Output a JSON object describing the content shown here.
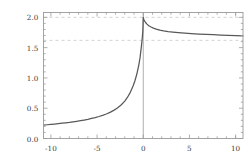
{
  "chart_data": {
    "type": "line",
    "title": "",
    "xlabel": "",
    "ylabel": "",
    "xlim": [
      -10.8,
      10.8
    ],
    "ylim": [
      0.0,
      2.08
    ],
    "grid": false,
    "frame": true,
    "legend": null,
    "x_ticks": [
      -10,
      -5,
      0,
      5,
      10
    ],
    "x_tick_labels": [
      "-10",
      "-5",
      "0",
      "5",
      "10"
    ],
    "x_minor_ticks": [
      -9,
      -8,
      -7,
      -6,
      -4,
      -3,
      -2,
      -1,
      1,
      2,
      3,
      4,
      6,
      7,
      8,
      9,
      10
    ],
    "y_ticks": [
      0.0,
      0.5,
      1.0,
      1.5,
      2.0
    ],
    "y_tick_labels": [
      "0.0",
      "0.5",
      "1.0",
      "1.5",
      "2.0"
    ],
    "y_minor_ticks": [
      0.1,
      0.2,
      0.3,
      0.4,
      0.6,
      0.7,
      0.8,
      0.9,
      1.1,
      1.2,
      1.3,
      1.4,
      1.6,
      1.7,
      1.8,
      1.9
    ],
    "curve_color": "#595959",
    "reference_line_color": "#c8c8c8",
    "axis_color": "#8c8c8c",
    "frame_color": "#9a9a9a",
    "reference_lines": [
      {
        "orientation": "horizontal",
        "value": 2.0,
        "style": "dashed"
      },
      {
        "orientation": "horizontal",
        "value": 1.62,
        "style": "dashed"
      },
      {
        "orientation": "vertical",
        "value": 0.0,
        "style": "solid"
      }
    ],
    "series": [
      {
        "name": "f(x)",
        "x": [
          -10.8,
          -10.4,
          -10.0,
          -9.6,
          -9.2,
          -8.8,
          -8.4,
          -8.0,
          -7.6,
          -7.2,
          -6.8,
          -6.4,
          -6.0,
          -5.6,
          -5.2,
          -4.8,
          -4.4,
          -4.0,
          -3.6,
          -3.2,
          -2.8,
          -2.4,
          -2.0,
          -1.7,
          -1.4,
          -1.1,
          -0.9,
          -0.7,
          -0.5,
          -0.35,
          -0.2,
          -0.1,
          -0.04,
          0.0,
          0.05,
          0.12,
          0.25,
          0.4,
          0.6,
          0.85,
          1.1,
          1.4,
          1.8,
          2.2,
          2.7,
          3.2,
          3.8,
          4.5,
          5.2,
          6.0,
          6.8,
          7.6,
          8.4,
          9.2,
          10.0,
          10.8
        ],
        "y": [
          0.222,
          0.227,
          0.233,
          0.239,
          0.245,
          0.252,
          0.259,
          0.266,
          0.275,
          0.284,
          0.294,
          0.305,
          0.317,
          0.331,
          0.346,
          0.363,
          0.383,
          0.405,
          0.432,
          0.464,
          0.503,
          0.553,
          0.618,
          0.682,
          0.762,
          0.866,
          0.953,
          1.06,
          1.2,
          1.33,
          1.52,
          1.67,
          1.8,
          2.0,
          1.97,
          1.945,
          1.915,
          1.888,
          1.862,
          1.84,
          1.822,
          1.806,
          1.789,
          1.776,
          1.765,
          1.756,
          1.747,
          1.738,
          1.731,
          1.724,
          1.718,
          1.713,
          1.708,
          1.704,
          1.7,
          1.696
        ]
      }
    ],
    "annotations": [
      {
        "label": "peak",
        "x": 0.0,
        "y": 2.0
      },
      {
        "label": "right_asymptote",
        "x": 10.8,
        "y": 1.696
      },
      {
        "label": "left_end",
        "x": -10.8,
        "y": 0.222
      }
    ]
  }
}
